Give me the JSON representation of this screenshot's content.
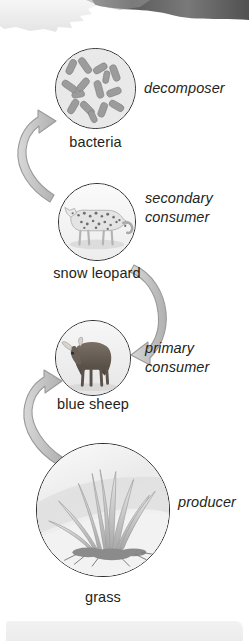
{
  "diagram": {
    "type": "energy-cycle",
    "title": "",
    "orientation": "vertical-cycle",
    "colors": {
      "circle_outline": "#2b2b2b",
      "arrow_fill": "#c9c9c9",
      "arrow_outline": "#8d8d8d",
      "text": "#231f20",
      "page_background": "#ffffff",
      "bottom_band": "#efefef"
    },
    "nodes": [
      {
        "id": "bacteria",
        "name": "bacteria",
        "role": "decomposer",
        "role_lines": [
          "decomposer"
        ],
        "icon": "bacteria-circle-icon",
        "order": 4
      },
      {
        "id": "snow-leopard",
        "name": "snow leopard",
        "role": "secondary consumer",
        "role_lines": [
          "secondary",
          "consumer"
        ],
        "icon": "snow-leopard-circle-icon",
        "order": 3
      },
      {
        "id": "blue-sheep",
        "name": "blue sheep",
        "role": "primary consumer",
        "role_lines": [
          "primary",
          "consumer"
        ],
        "icon": "blue-sheep-circle-icon",
        "order": 2
      },
      {
        "id": "grass",
        "name": "grass",
        "role": "producer",
        "role_lines": [
          "producer"
        ],
        "icon": "grass-circle-icon",
        "order": 1
      }
    ],
    "arrows": [
      {
        "id": "grass-to-blue-sheep",
        "from": "grass",
        "to": "blue-sheep",
        "direction": "up"
      },
      {
        "id": "blue-sheep-to-snow-leopard",
        "from": "blue-sheep",
        "to": "snow-leopard",
        "direction": "up"
      },
      {
        "id": "snow-leopard-to-bacteria",
        "from": "snow-leopard",
        "to": "bacteria",
        "direction": "up"
      }
    ]
  }
}
